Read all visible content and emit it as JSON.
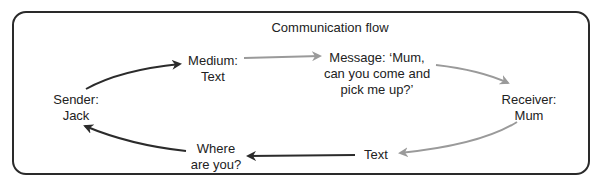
{
  "diagram": {
    "title": "Communication flow",
    "nodes": {
      "sender": {
        "line1": "Sender:",
        "line2": "Jack"
      },
      "medium": {
        "line1": "Medium:",
        "line2": "Text"
      },
      "message": {
        "line1": "Message: ‘Mum,",
        "line2": "can you come and",
        "line3": "pick me up?’"
      },
      "receiver": {
        "line1": "Receiver:",
        "line2": "Mum"
      },
      "feedback_medium": {
        "line1": "Text"
      },
      "feedback": {
        "line1": "Where",
        "line2": "are you?"
      }
    },
    "colors": {
      "dark_arrow": "#2b2b2b",
      "light_arrow": "#aaaaaa",
      "frame": "#2a2a2a"
    }
  }
}
